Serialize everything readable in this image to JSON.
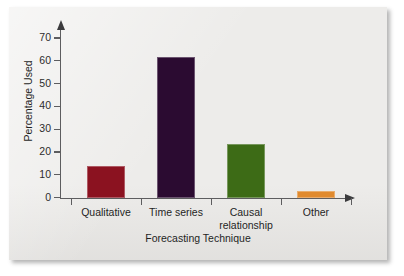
{
  "figure": {
    "background_color": "#edecea",
    "axis_color": "#5d5d5f",
    "text_color": "#1f1f1f"
  },
  "chart_data": {
    "type": "bar",
    "title": "",
    "subtitle": "",
    "xlabel": "Forecasting Technique",
    "ylabel": "Percentage Used",
    "categories": [
      "Qualitative",
      "Time series",
      "Causal\nrelationship",
      "Other"
    ],
    "values": [
      14,
      61.5,
      23.5,
      3
    ],
    "bar_colors": [
      "#8b1220",
      "#2b0b31",
      "#3d6b16",
      "#e08a2e"
    ],
    "ylim": [
      0,
      72
    ],
    "yticks": [
      0,
      10,
      20,
      30,
      40,
      50,
      60,
      70
    ],
    "ytick_labels": [
      "0",
      "10",
      "20",
      "30",
      "40",
      "50",
      "60",
      "70"
    ],
    "grid": false,
    "legend": false,
    "legend_position": "none",
    "axis_arrows": true
  }
}
